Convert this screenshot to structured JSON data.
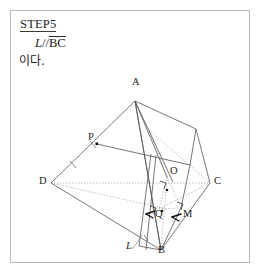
{
  "page": {
    "width": 262,
    "height": 275,
    "background": "#ffffff",
    "border_color": "#b9b9b9"
  },
  "header": {
    "step_label": "STEP5",
    "formula_left": "L",
    "formula_parallel": "//",
    "formula_segment": "BC",
    "korean_text": "이다."
  },
  "figure": {
    "caption_type": "3d-solid-geometry-diagram",
    "line_color": "#4a4a4a",
    "dotted_color": "#8f8f8f",
    "point_color": "#111111",
    "vertices": [
      {
        "name": "A",
        "label": "A",
        "x": 124,
        "y": 88,
        "label_dx": -3,
        "label_dy": -11
      },
      {
        "name": "B",
        "label": "B",
        "x": 150,
        "y": 239,
        "label_dx": -3,
        "label_dy": 6
      },
      {
        "name": "C",
        "label": "C",
        "x": 199,
        "y": 172,
        "label_dx": 5,
        "label_dy": -5
      },
      {
        "name": "D",
        "label": "D",
        "x": 40,
        "y": 172,
        "label_dx": -11,
        "label_dy": -5
      },
      {
        "name": "P",
        "label": "P",
        "x": 86,
        "y": 133,
        "label_dx": -4,
        "label_dy": -12
      },
      {
        "name": "O",
        "label": "O",
        "x": 156,
        "y": 166,
        "label_dx": 3,
        "label_dy": -10
      },
      {
        "name": "Q",
        "label": "Q",
        "x": 148,
        "y": 198,
        "label_dx": -3,
        "label_dy": 9
      },
      {
        "name": "M",
        "label": "M",
        "x": 170,
        "y": 197,
        "label_dx": 3,
        "label_dy": 9
      },
      {
        "name": "L",
        "label": "L",
        "x": 118,
        "y": 233,
        "label_dx": -2,
        "label_dy": 5
      }
    ],
    "marks": {
      "tick_on_AP": true,
      "tick_on_PD": true,
      "tick_on_B_edge": true,
      "right_angle_at_Q": true,
      "right_angle_at_M": true,
      "right_angle_at_O": true
    }
  }
}
